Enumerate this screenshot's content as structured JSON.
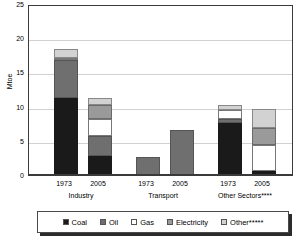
{
  "chart_data": {
    "type": "bar",
    "subtype": "stacked-grouped",
    "title": "",
    "xlabel": "",
    "ylabel": "Mtoe",
    "ylim": [
      0,
      25
    ],
    "yticks": [
      0,
      5,
      10,
      15,
      20,
      25
    ],
    "grid": true,
    "legend_position": "bottom",
    "series": [
      {
        "name": "Coal",
        "color": "#1a1a1a",
        "values": [
          11.4,
          2.8,
          0.05,
          0.0,
          7.7,
          0.6
        ]
      },
      {
        "name": "Oil",
        "color": "#6f6f6f",
        "values": [
          5.5,
          2.9,
          2.65,
          6.7,
          0.6,
          0.0
        ]
      },
      {
        "name": "Gas",
        "color": "#ffffff",
        "values": [
          0.4,
          2.5,
          0.0,
          0.0,
          1.3,
          3.8
        ]
      },
      {
        "name": "Electricity",
        "color": "#9a9a9a",
        "values": [
          0.0,
          2.1,
          0.0,
          0.0,
          0.0,
          2.5
        ]
      },
      {
        "name": "Other*****",
        "color": "#d2d2d2",
        "values": [
          1.3,
          1.0,
          0.0,
          0.0,
          0.7,
          2.8
        ]
      }
    ],
    "x": [
      "1973",
      "2005",
      "1973",
      "2005",
      "1973",
      "2005"
    ],
    "totals": [
      18.6,
      11.3,
      2.7,
      6.7,
      10.3,
      9.7
    ],
    "groups": [
      {
        "label": "Industry",
        "years": [
          "1973",
          "2005"
        ]
      },
      {
        "label": "Transport",
        "years": [
          "1973",
          "2005"
        ]
      },
      {
        "label": "Other Sectors****",
        "years": [
          "1973",
          "2005"
        ]
      }
    ]
  },
  "axis": {
    "y_label": "Mtoe",
    "y_ticks": [
      "0",
      "5",
      "10",
      "15",
      "20",
      "25"
    ]
  },
  "legend": {
    "items": [
      {
        "label": "Coal"
      },
      {
        "label": "Oil"
      },
      {
        "label": "Gas"
      },
      {
        "label": "Electricity"
      },
      {
        "label": "Other*****"
      }
    ]
  },
  "xaxis": {
    "years": [
      "1973",
      "2005",
      "1973",
      "2005",
      "1973",
      "2005"
    ],
    "groups": [
      "Industry",
      "Transport",
      "Other Sectors****"
    ]
  }
}
